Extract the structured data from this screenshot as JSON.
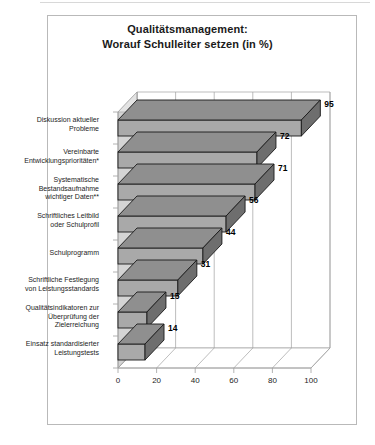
{
  "title": {
    "line1": "Qualitätsmanagement:",
    "line2": "Worauf Schulleiter setzen (in %)"
  },
  "chart_data": {
    "type": "bar",
    "orientation": "horizontal",
    "style": "3d",
    "title": "Qualitätsmanagement: Worauf Schulleiter setzen (in %)",
    "xlabel": "",
    "ylabel": "",
    "xlim": [
      0,
      100
    ],
    "xticks": [
      "0",
      "20",
      "40",
      "60",
      "80",
      "100"
    ],
    "grid": true,
    "legend": "none",
    "categories": [
      "Diskussion aktueller Probleme",
      "Vereinbarte Entwicklungsprioritäten*",
      "Systematische Bestandsaufnahme wichtiger Daten**",
      "Schriftliches Leitbild oder Schulprofil",
      "Schulprogramm",
      "Schriftliche Festlegung von Leistungsstandards",
      "Qualitätsindikatoren zur Überprüfung der Zielerreichung",
      "Einsatz standardisierter Leistungstests"
    ],
    "category_lines": [
      [
        "Diskussion aktueller",
        "Probleme"
      ],
      [
        "Vereinbarte",
        "Entwicklungsprioritäten*"
      ],
      [
        "Systematische",
        "Bestandsaufnahme",
        "wichtiger Daten**"
      ],
      [
        "Schriftliches Leitbild",
        "oder Schulprofil"
      ],
      [
        "Schulprogramm"
      ],
      [
        "Schriftliche Festlegung",
        "von Leistungsstandards"
      ],
      [
        "Qualitätsindikatoren zur",
        "Überprüfung der",
        "Zielerreichung"
      ],
      [
        "Einsatz standardisierter",
        "Leistungstests"
      ]
    ],
    "values": [
      95,
      72,
      71,
      56,
      44,
      31,
      15,
      14
    ],
    "value_labels": [
      "95",
      "72",
      "71",
      "56",
      "44",
      "31",
      "15",
      "14"
    ],
    "colors": {
      "bar_face": "#a9a9a9",
      "bar_top": "#8f8f8f",
      "bar_side": "#6e6e6e",
      "outline": "#1a1a1a",
      "wall": "#d4d4d4",
      "grid": "#a0a0a0",
      "frame": "#b9b9b9",
      "text": "#1d1d1d"
    }
  }
}
